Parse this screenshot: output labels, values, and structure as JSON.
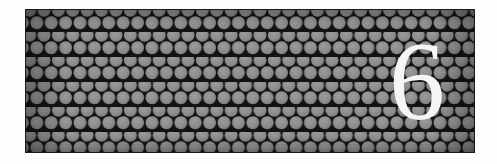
{
  "page": {
    "kind": "chapter-divider-banner",
    "width": 497,
    "height": 164,
    "background_color": "#fdfdfd"
  },
  "panel": {
    "label": "patterned-banner",
    "x": 26,
    "y": 10,
    "width": 448,
    "height": 142,
    "background_color": "#121212",
    "border_color": "#1a1a1a"
  },
  "pattern": {
    "name": "circle-lattice",
    "shape": "circle",
    "arrangement": "hexagonal-offset",
    "dot_color": "#8d8d8d",
    "dot_highlight_color": "#9a9a9a",
    "gap_color": "#101010",
    "dot_radius": 6.6,
    "column_spacing": 14.4,
    "row_spacing": 12.5
  },
  "numeral": {
    "value": "6",
    "label": "chapter-number",
    "color": "#f7f5f1",
    "font_size_px": 112,
    "center_x": 389,
    "center_y": 76,
    "bbox": {
      "x": 362,
      "y": 33,
      "width": 50,
      "height": 86
    }
  }
}
